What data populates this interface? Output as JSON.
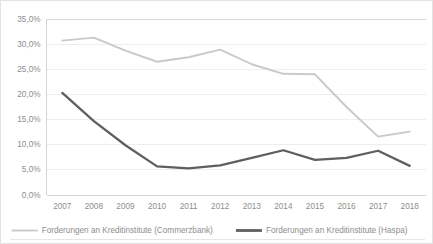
{
  "chart_data": {
    "type": "line",
    "title": "",
    "xlabel": "",
    "ylabel": "",
    "categories": [
      "2007",
      "2008",
      "2009",
      "2010",
      "2011",
      "2012",
      "2013",
      "2014",
      "2015",
      "2016",
      "2017",
      "2018"
    ],
    "series": [
      {
        "name": "Forderungen an Kreditinstitute (Commerzbank)",
        "color": "#c9c9c9",
        "values": [
          30.6,
          31.2,
          28.6,
          26.4,
          27.3,
          28.8,
          25.9,
          24.0,
          23.9,
          17.4,
          11.5,
          12.5
        ]
      },
      {
        "name": "Forderungen an Kreditinstitute (Haspa)",
        "color": "#5f5f5f",
        "values": [
          20.2,
          14.6,
          9.8,
          5.6,
          5.2,
          5.8,
          7.3,
          8.8,
          6.9,
          7.3,
          8.7,
          5.7
        ]
      }
    ],
    "ylim": [
      0,
      35
    ],
    "yticks": [
      "0,0%",
      "5,0%",
      "10,0%",
      "15,0%",
      "20,0%",
      "25,0%",
      "30,0%",
      "35,0%"
    ],
    "ytick_values": [
      0,
      5,
      10,
      15,
      20,
      25,
      30,
      35
    ],
    "grid": true,
    "legend_position": "bottom"
  },
  "legend": {
    "entries": [
      {
        "label": "Forderungen an Kreditinstitute (Commerzbank)",
        "color": "#c9c9c9"
      },
      {
        "label": "Forderungen an Kreditinstitute (Haspa)",
        "color": "#5f5f5f"
      }
    ]
  }
}
